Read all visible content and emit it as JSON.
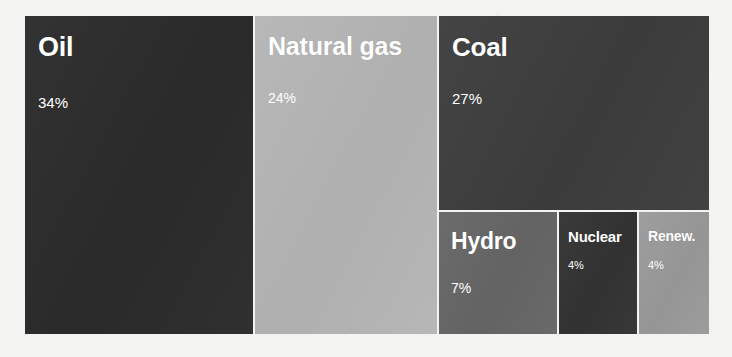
{
  "background_color": "#f3f3f1",
  "chart_data": {
    "type": "treemap",
    "title": "",
    "subtitle": "",
    "xlabel": "",
    "ylabel": "",
    "unit": "%",
    "legend": "none",
    "grid": false,
    "categories": [
      "Oil",
      "Natural gas",
      "Coal",
      "Hydro",
      "Nuclear",
      "Renew."
    ],
    "values": [
      34,
      24,
      27,
      7,
      4,
      4
    ],
    "value_labels": [
      "34%",
      "24%",
      "27%",
      "7%",
      "4%",
      "4%"
    ],
    "colors": [
      "#2b2b2b",
      "#b5b5b5",
      "#3d3d3d",
      "#666666",
      "#333333",
      "#9a9a9a"
    ],
    "tiles": [
      {
        "id": "oil",
        "label": "Oil",
        "value": 34,
        "value_label": "34%",
        "color": "#2b2b2b",
        "text_color": "#ffffff"
      },
      {
        "id": "natural-gas",
        "label": "Natural gas",
        "value": 24,
        "value_label": "24%",
        "color": "#b5b5b5",
        "text_color": "#ffffff"
      },
      {
        "id": "coal",
        "label": "Coal",
        "value": 27,
        "value_label": "27%",
        "color": "#3d3d3d",
        "text_color": "#ffffff"
      },
      {
        "id": "hydro",
        "label": "Hydro",
        "value": 7,
        "value_label": "7%",
        "color": "#666666",
        "text_color": "#ffffff"
      },
      {
        "id": "nuclear",
        "label": "Nuclear",
        "value": 4,
        "value_label": "4%",
        "color": "#333333",
        "text_color": "#ffffff"
      },
      {
        "id": "renewables",
        "label": "Renew.",
        "value": 4,
        "value_label": "4%",
        "color": "#9a9a9a",
        "text_color": "#ffffff"
      }
    ]
  }
}
